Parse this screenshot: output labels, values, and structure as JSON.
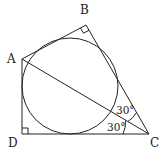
{
  "diagram": {
    "type": "geometry",
    "points": {
      "A": {
        "label": "A",
        "x": 22,
        "y": 59
      },
      "B": {
        "label": "B",
        "x": 86,
        "y": 25
      },
      "C": {
        "label": "C",
        "x": 149,
        "y": 134
      },
      "D": {
        "label": "D",
        "x": 22,
        "y": 134
      }
    },
    "right_angles": [
      "B",
      "D"
    ],
    "segments": [
      "AB",
      "BC",
      "CD",
      "DA",
      "AC"
    ],
    "circle": {
      "inscribed": true,
      "cx": 70,
      "cy": 86,
      "r": 48
    },
    "angles": [
      {
        "label": "30°",
        "at": "C",
        "between": "BC-AC"
      },
      {
        "label": "30°",
        "at": "C",
        "between": "AC-DC"
      }
    ]
  }
}
